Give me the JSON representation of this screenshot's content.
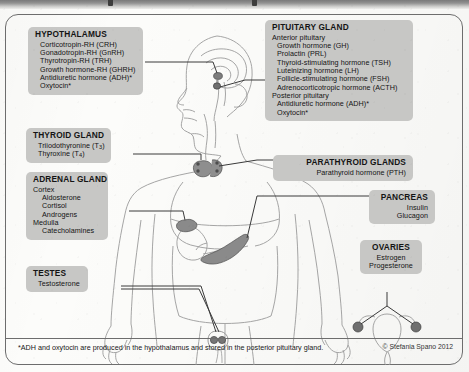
{
  "figure": {
    "footnote": "*ADH and oxytocin are produced in the hypothalamus and stored in the posterior pituitary gland.",
    "copyright": "© Stefania Spano 2012",
    "box_fill": "#c7c7c5",
    "line_color": "#3a3a3a",
    "gland_fill": "#8e8e8e",
    "body_outline": "#9b9b9b"
  },
  "labels": {
    "hypothalamus": {
      "title": "HYPOTHALAMUS",
      "items": [
        "Corticotropin-RH (CRH)",
        "Gonadotropin-RH (GnRH)",
        "Thyrotropin-RH (TRH)",
        "Growth hormone-RH (GHRH)",
        "Antidiuretic hormone (ADH)*",
        "Oxytocin*"
      ]
    },
    "thyroid": {
      "title": "THYROID GLAND",
      "items": [
        "Triiodothyronine (T3)",
        "Thyroxine (T4)"
      ]
    },
    "adrenal": {
      "title": "ADRENAL GLAND",
      "items": [
        "Cortex",
        "Aldosterone",
        "Cortisol",
        "Androgens",
        "Medulla",
        "Catecholamines"
      ]
    },
    "testes": {
      "title": "TESTES",
      "items": [
        "Testosterone"
      ]
    },
    "pituitary": {
      "title": "PITUITARY GLAND",
      "anterior_heading": "Anterior pituitary",
      "anterior_items": [
        "Growth hormone (GH)",
        "Prolactin (PRL)",
        "Thyroid-stimulating hormone (TSH)",
        "Luteinizing hormone (LH)",
        "Follicle-stimulating hormone (FSH)",
        "Adrenocorticotropic hormone (ACTH)"
      ],
      "posterior_heading": "Posterior pituitary",
      "posterior_items": [
        "Antidiuretic hormone (ADH)*",
        "Oxytocin*"
      ]
    },
    "parathyroid": {
      "title": "PARATHYROID GLANDS",
      "items": [
        "Parathyroid hormone (PTH)"
      ]
    },
    "pancreas": {
      "title": "PANCREAS",
      "items": [
        "Insulin",
        "Glucagon"
      ]
    },
    "ovaries": {
      "title": "OVARIES",
      "items": [
        "Estrogen",
        "Progesterone"
      ]
    }
  }
}
